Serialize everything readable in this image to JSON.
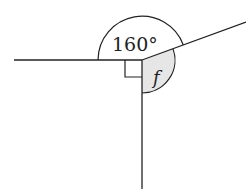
{
  "diagram": {
    "type": "angles at a point",
    "labels": {
      "angle_large": "160°",
      "angle_unknown": "f"
    },
    "right_angle_marker": true,
    "colors": {
      "line": "#222222",
      "shade": "#e6e6e6",
      "background": "#ffffff"
    }
  }
}
